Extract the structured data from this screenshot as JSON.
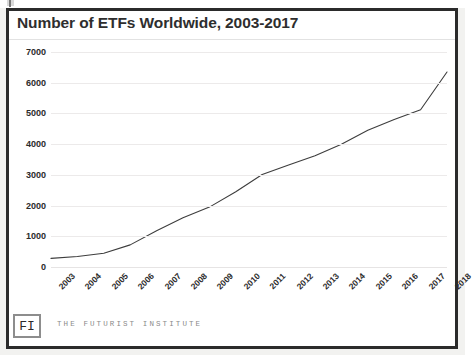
{
  "frame": {
    "title": "Number of ETFs Worldwide, 2003-2017"
  },
  "footer": {
    "source_note": "Source: Statista",
    "logo_label": "FI",
    "brand_text": "THE FUTURIST INSTITUTE"
  },
  "colors": {
    "line": "#3d3d3d",
    "grid": "#eceaea",
    "frame": "#2b2b2b",
    "text": "#2b2b2b",
    "muted": "#8a8a8a",
    "background": "#ffffff"
  },
  "chart_data": {
    "type": "line",
    "title": "Number of ETFs Worldwide, 2003-2017",
    "xlabel": "",
    "ylabel": "",
    "x": [
      "2003",
      "2004",
      "2005",
      "2006",
      "2007",
      "2008",
      "2009",
      "2010",
      "2011",
      "2012",
      "2013",
      "2014",
      "2015",
      "2016",
      "2017",
      "2018"
    ],
    "values": [
      280,
      340,
      450,
      720,
      1180,
      1600,
      1950,
      2450,
      3010,
      3320,
      3620,
      4000,
      4450,
      4800,
      5120,
      6350
    ],
    "xlim": [
      "2003",
      "2018"
    ],
    "ylim": [
      0,
      7000
    ],
    "yticks": [
      0,
      1000,
      2000,
      3000,
      4000,
      5000,
      6000,
      7000
    ],
    "ytick_labels": [
      "0",
      "1000",
      "2000",
      "3000",
      "4000",
      "5000",
      "6000",
      "7000"
    ],
    "grid": true,
    "legend": false,
    "series": [
      {
        "name": "Number of ETFs",
        "values": [
          280,
          340,
          450,
          720,
          1180,
          1600,
          1950,
          2450,
          3010,
          3320,
          3620,
          4000,
          4450,
          4800,
          5120,
          6350
        ]
      }
    ]
  }
}
